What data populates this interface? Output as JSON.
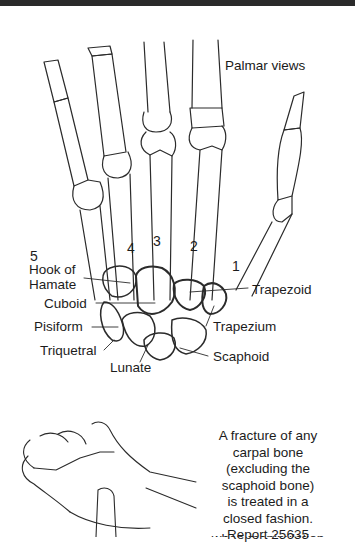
{
  "figure": {
    "title": "Palmar views",
    "metacarpal_numbers": [
      "5",
      "4",
      "3",
      "2",
      "1"
    ],
    "labels": {
      "hook_of_hamate": [
        "Hook of",
        "Hamate"
      ],
      "cuboid": "Cuboid",
      "pisiform": "Pisiform",
      "triquetral": "Triquetral",
      "lunate": "Lunate",
      "trapezoid": "Trapezoid",
      "trapezium": "Trapezium",
      "scaphoid": "Scaphoid"
    },
    "colors": {
      "line": "#2b2b2b",
      "rule": "#2a2a2a",
      "background": "#ffffff"
    }
  },
  "caption": {
    "lines": [
      "A fracture of any",
      "carpal bone",
      "(excluding the",
      "scaphoid bone)",
      "is treated in a",
      "closed fashion.",
      "Report 25635"
    ],
    "cut_off_line": "when manipulation"
  }
}
